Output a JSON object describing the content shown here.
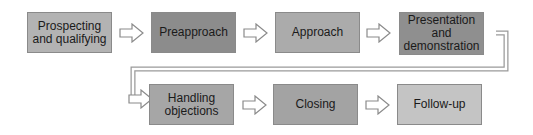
{
  "diagram": {
    "type": "process-flow",
    "steps": [
      {
        "label": "Prospecting and qualifying",
        "line1": "Prospecting",
        "line2": "and qualifying",
        "color": "#b3b3b3"
      },
      {
        "label": "Preapproach",
        "color": "#8c8c8c"
      },
      {
        "label": "Approach",
        "color": "#ababab"
      },
      {
        "label": "Presentation and demonstration",
        "line1": "Presentation",
        "line2": "and",
        "line3": "demonstration",
        "color": "#8f8f8f"
      },
      {
        "label": "Handling objections",
        "line1": "Handling",
        "line2": "objections",
        "color": "#a6a6a6"
      },
      {
        "label": "Closing",
        "color": "#a3a3a3"
      },
      {
        "label": "Follow-up",
        "color": "#c4c4c4"
      }
    ],
    "connector_color": "#9a9a9a"
  }
}
